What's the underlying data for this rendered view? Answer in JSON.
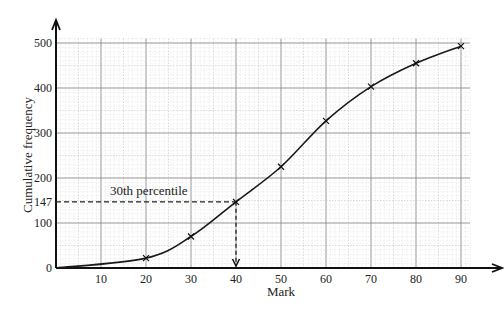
{
  "chart_data": {
    "type": "line",
    "title": "",
    "xlabel": "Mark",
    "ylabel": "Cumulative frequency",
    "xlim": [
      0,
      94
    ],
    "ylim": [
      0,
      540
    ],
    "x_ticks": [
      10,
      20,
      30,
      40,
      50,
      60,
      70,
      80,
      90
    ],
    "y_ticks": [
      0,
      100,
      147,
      200,
      300,
      400,
      500
    ],
    "grid": true,
    "series": [
      {
        "name": "Cumulative frequency curve",
        "x": [
          0,
          20,
          30,
          40,
          50,
          60,
          70,
          80,
          90
        ],
        "y": [
          0,
          22,
          70,
          147,
          225,
          327,
          403,
          455,
          493
        ],
        "markers": "x"
      }
    ],
    "annotations": [
      {
        "text": "30th percentile",
        "type": "dashed-lookup",
        "y_value": 147,
        "x_value": 40
      }
    ]
  }
}
